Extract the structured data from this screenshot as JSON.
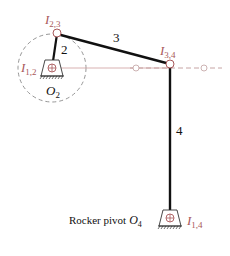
{
  "diagram": {
    "colors": {
      "link": "#111111",
      "instant_center": "#a8585a",
      "construction_line": "#c89a9a",
      "dashed_circle": "#888888",
      "text": "#111111"
    },
    "links": [
      {
        "id": "2",
        "label": "2"
      },
      {
        "id": "3",
        "label": "3"
      },
      {
        "id": "4",
        "label": "4"
      }
    ],
    "instant_centers": {
      "i23": {
        "base": "I",
        "sub": "2,3"
      },
      "i12": {
        "base": "I",
        "sub": "1,2"
      },
      "i34": {
        "base": "I",
        "sub": "3,4"
      },
      "i14": {
        "base": "I",
        "sub": "1,4"
      }
    },
    "pivots": {
      "o2": {
        "base": "O",
        "sub": "2"
      },
      "o4_caption": "Rocker pivot",
      "o4": {
        "base": "O",
        "sub": "4"
      }
    }
  }
}
